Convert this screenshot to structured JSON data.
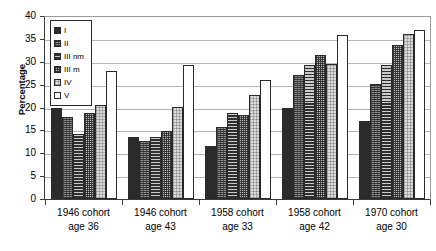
{
  "chart_data": {
    "type": "bar",
    "title": "",
    "xlabel": "",
    "ylabel": "Percentage",
    "ylim": [
      0,
      40
    ],
    "yticks": [
      0,
      5,
      10,
      15,
      20,
      25,
      30,
      35,
      40
    ],
    "grid": true,
    "legend_position": "top-left-inside",
    "categories": [
      "1946 cohort age 36",
      "1946 cohort age 43",
      "1958 cohort age 33",
      "1958 cohort age 42",
      "1970 cohort age 30"
    ],
    "category_lines": [
      [
        "1946 cohort",
        "age 36"
      ],
      [
        "1946 cohort",
        "age 43"
      ],
      [
        "1958 cohort",
        "age 33"
      ],
      [
        "1958 cohort",
        "age 42"
      ],
      [
        "1970 cohort",
        "age 30"
      ]
    ],
    "series": [
      {
        "name": "I",
        "values": [
          20.0,
          13.5,
          11.5,
          19.8,
          17.0
        ]
      },
      {
        "name": "II",
        "values": [
          18.0,
          12.6,
          15.8,
          27.2,
          25.1
        ]
      },
      {
        "name": "III nm",
        "values": [
          14.2,
          13.5,
          18.7,
          29.2,
          29.4
        ]
      },
      {
        "name": "III m",
        "values": [
          18.8,
          14.8,
          18.3,
          31.4,
          33.7
        ]
      },
      {
        "name": "IV",
        "values": [
          20.6,
          20.1,
          22.8,
          29.6,
          36.1
        ]
      },
      {
        "name": "V",
        "values": [
          28.0,
          29.3,
          26.0,
          35.8,
          36.9
        ]
      }
    ]
  },
  "legend": {
    "items": [
      {
        "label": "I"
      },
      {
        "label": "II"
      },
      {
        "label": "III nm"
      },
      {
        "label": "III m"
      },
      {
        "label": "IV"
      },
      {
        "label": "V"
      }
    ]
  }
}
